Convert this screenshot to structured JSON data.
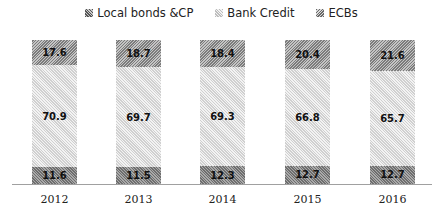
{
  "legend": {
    "items": [
      {
        "label": "Local bonds &CP",
        "pattern": "local"
      },
      {
        "label": "Bank Credit",
        "pattern": "bank"
      },
      {
        "label": "ECBs",
        "pattern": "ecb"
      }
    ]
  },
  "chart_data": {
    "type": "bar",
    "stacked": true,
    "title": "",
    "xlabel": "",
    "ylabel": "",
    "categories": [
      "2012",
      "2013",
      "2014",
      "2015",
      "2016"
    ],
    "series": [
      {
        "name": "Local bonds &CP",
        "values": [
          11.6,
          11.5,
          12.3,
          12.7,
          12.7
        ]
      },
      {
        "name": "Bank Credit",
        "values": [
          70.9,
          69.7,
          69.3,
          66.8,
          65.7
        ]
      },
      {
        "name": "ECBs",
        "values": [
          17.6,
          18.7,
          18.4,
          20.4,
          21.6
        ]
      }
    ],
    "data_labels": true,
    "grid": false,
    "legend_position": "top",
    "ylim": [
      0,
      100
    ]
  },
  "layout": {
    "bar_lefts": [
      32,
      116,
      200,
      285,
      370
    ],
    "plot_height_px": 144
  }
}
